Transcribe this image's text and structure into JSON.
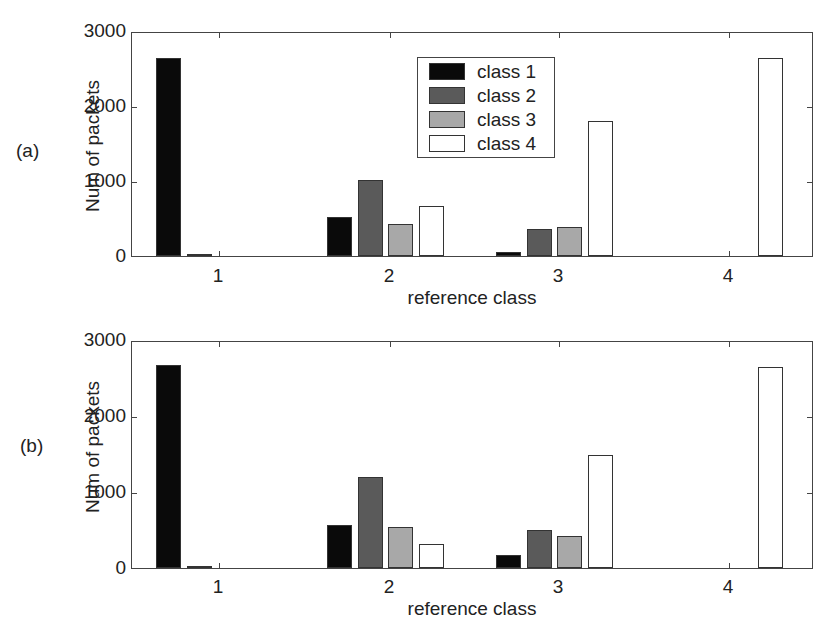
{
  "colors": {
    "class1": "#0a0a0a",
    "class2": "#5a5a5a",
    "class3": "#a8a8a8",
    "class4": "#ffffff"
  },
  "legend": [
    "class 1",
    "class 2",
    "class 3",
    "class 4"
  ],
  "panels": [
    {
      "tag": "(a)",
      "ylabel": "Num of packets",
      "xlabel": "reference class",
      "yticks": [
        "0",
        "1000",
        "2000",
        "3000"
      ],
      "xticks": [
        "1",
        "2",
        "3",
        "4"
      ]
    },
    {
      "tag": "(b)",
      "ylabel": "Num of packets",
      "xlabel": "reference class",
      "yticks": [
        "0",
        "1000",
        "2000",
        "3000"
      ],
      "xticks": [
        "1",
        "2",
        "3",
        "4"
      ]
    }
  ],
  "chart_data": [
    {
      "type": "bar",
      "title": "(a)",
      "xlabel": "reference class",
      "ylabel": "Num of packets",
      "categories": [
        "1",
        "2",
        "3",
        "4"
      ],
      "ylim": [
        0,
        3000
      ],
      "yticks": [
        0,
        1000,
        2000,
        3000
      ],
      "grid": false,
      "legend_position": "upper center",
      "series": [
        {
          "name": "class 1",
          "color": "#0a0a0a",
          "values": [
            2670,
            530,
            60,
            0
          ]
        },
        {
          "name": "class 2",
          "color": "#5a5a5a",
          "values": [
            20,
            1025,
            365,
            0
          ]
        },
        {
          "name": "class 3",
          "color": "#a8a8a8",
          "values": [
            0,
            435,
            385,
            0
          ]
        },
        {
          "name": "class 4",
          "color": "#ffffff",
          "values": [
            0,
            670,
            1810,
            2660
          ]
        }
      ]
    },
    {
      "type": "bar",
      "title": "(b)",
      "xlabel": "reference class",
      "ylabel": "Num of packets",
      "categories": [
        "1",
        "2",
        "3",
        "4"
      ],
      "ylim": [
        0,
        3000
      ],
      "yticks": [
        0,
        1000,
        2000,
        3000
      ],
      "grid": false,
      "series": [
        {
          "name": "class 1",
          "color": "#0a0a0a",
          "values": [
            2690,
            570,
            175,
            0
          ]
        },
        {
          "name": "class 2",
          "color": "#5a5a5a",
          "values": [
            5,
            1205,
            510,
            0
          ]
        },
        {
          "name": "class 3",
          "color": "#a8a8a8",
          "values": [
            0,
            540,
            425,
            0
          ]
        },
        {
          "name": "class 4",
          "color": "#ffffff",
          "values": [
            0,
            320,
            1495,
            2665
          ]
        }
      ]
    }
  ]
}
